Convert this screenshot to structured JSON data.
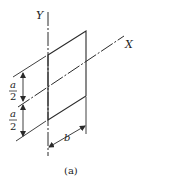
{
  "figure": {
    "caption": "(a)",
    "axes": {
      "y_label": "Y",
      "x_label": "X"
    },
    "dimensions": {
      "upper_half": {
        "numerator": "a",
        "denominator": "2"
      },
      "lower_half": {
        "numerator": "a",
        "denominator": "2"
      },
      "width": "b"
    },
    "colors": {
      "line": "#2a2a2a",
      "background": "#ffffff"
    }
  }
}
